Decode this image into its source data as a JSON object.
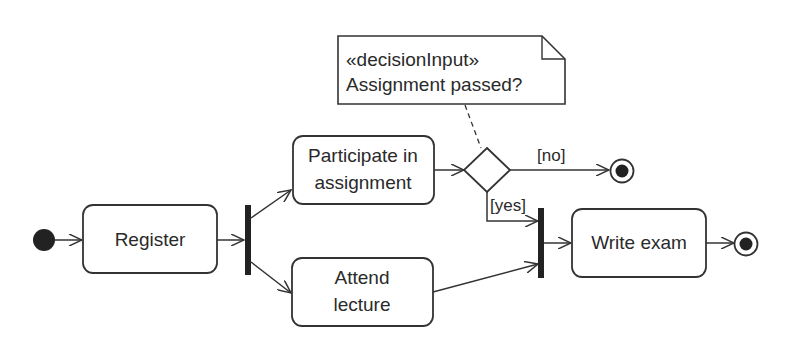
{
  "diagram": {
    "type": "UML activity diagram",
    "colors": {
      "stroke": "#333333",
      "fill": "#ffffff",
      "text": "#2a2a2a",
      "bar": "#222222"
    },
    "actions": [
      {
        "id": "register",
        "label": "Register"
      },
      {
        "id": "participate",
        "label_line1": "Participate in",
        "label_line2": "assignment"
      },
      {
        "id": "attend",
        "label_line1": "Attend",
        "label_line2": "lecture"
      },
      {
        "id": "write_exam",
        "label": "Write exam"
      }
    ],
    "note": {
      "stereotype": "«decisionInput»",
      "text": "Assignment passed?"
    },
    "guards": {
      "no": "[no]",
      "yes": "[yes]"
    },
    "nodes": {
      "initial": "initial-node",
      "fork": "fork-bar",
      "decision": "decision-node",
      "join": "join-bar",
      "final_no": "activity-final",
      "final_end": "activity-final"
    }
  }
}
